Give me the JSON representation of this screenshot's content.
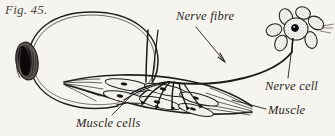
{
  "figure": {
    "number_label": "Fig. 45.",
    "background_color": "#f6f4ef",
    "ink_color": "#211f1d",
    "text_color": "#2a2724",
    "width": 335,
    "height": 136
  },
  "labels": {
    "nerve_fibre": "Nerve fibre",
    "nerve_cell": "Nerve cell",
    "muscle": "Muscle",
    "muscle_cells": "Muscle cells"
  },
  "parts": {
    "eyeball": "eyeball-outline",
    "lens": "lens-iris",
    "optic_structure": "eye-lens-shading",
    "nerve_fibre_path": "nerve-fibre-curve",
    "nerve_cell_body": "nerve-cell-star",
    "nerve_cell_nucleus": "nerve-cell-nucleus",
    "muscle_bundle": "muscle-spindle",
    "muscle_cells_group": "muscle-cell-fibres",
    "nerve_endings": "nerve-terminal-branches"
  },
  "leaders": {
    "nerve_fibre_arrow": "arrow pointing down-right to nerve fibre",
    "nerve_cell_line": "line from nerve cell body down to label",
    "muscle_line": "horizontal dash to muscle label",
    "muscle_cells_line": "line angling up-right to muscle cells"
  }
}
